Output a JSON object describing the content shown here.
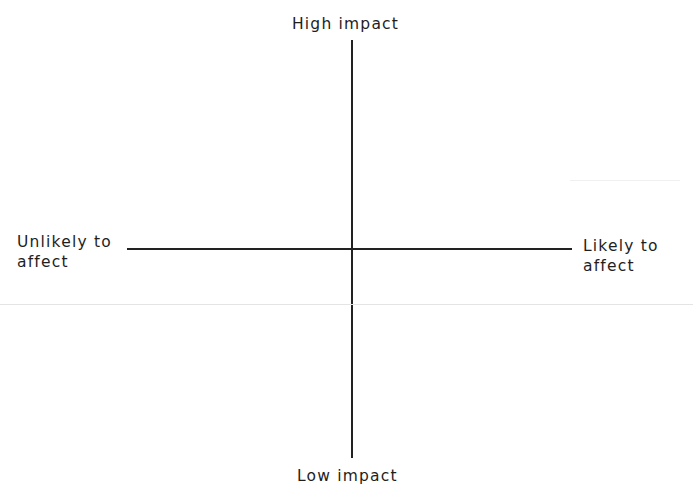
{
  "diagram": {
    "type": "quadrant",
    "labels": {
      "top": "High impact",
      "bottom": "Low impact",
      "left_line1": "Unlikely to",
      "left_line2": "affect",
      "right_line1": "Likely to",
      "right_line2": "affect"
    },
    "colors": {
      "axis": "#222222",
      "text": "#1e1e1e",
      "background": "#ffffff"
    }
  }
}
